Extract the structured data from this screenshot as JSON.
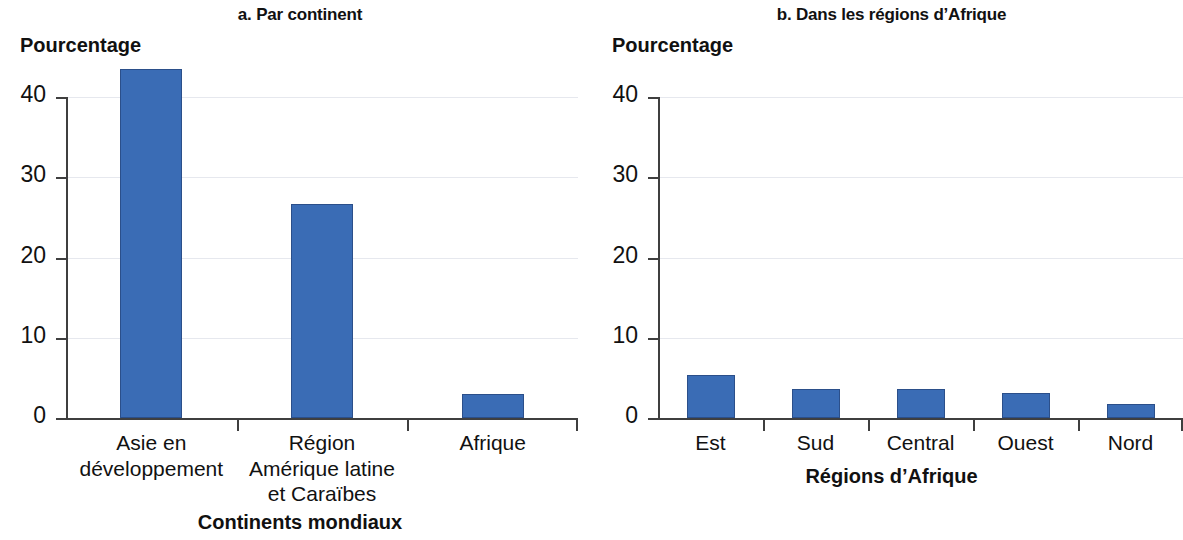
{
  "figure": {
    "background": "#ffffff",
    "bar_color": "#3a6cb5",
    "bar_edge_color": "#2b4f8a",
    "grid_color": "#e6e8ee",
    "axis_color": "#3f3f3f"
  },
  "chart_data": [
    {
      "type": "bar",
      "panel": "a",
      "title": "a. Par continent",
      "ylabel": "Pourcentage",
      "xlabel": "Continents mondiaux",
      "categories": [
        "Asie en\ndéveloppement",
        "Région\nAmérique latine\net Caraïbes",
        "Afrique"
      ],
      "values": [
        43.5,
        26.7,
        3.0
      ],
      "yticks": [
        "0",
        "10",
        "20",
        "30",
        "40"
      ],
      "ytick_values": [
        0,
        10,
        20,
        30,
        40
      ],
      "ylim": [
        0,
        44
      ],
      "grid": "horizontal",
      "legend": "none"
    },
    {
      "type": "bar",
      "panel": "b",
      "title": "b. Dans les régions d’Afrique",
      "ylabel": "Pourcentage",
      "xlabel": "Régions d’Afrique",
      "categories": [
        "Est",
        "Sud",
        "Central",
        "Ouest",
        "Nord"
      ],
      "values": [
        5.4,
        3.6,
        3.6,
        3.1,
        1.7
      ],
      "yticks": [
        "0",
        "10",
        "20",
        "30",
        "40"
      ],
      "ytick_values": [
        0,
        10,
        20,
        30,
        40
      ],
      "ylim": [
        0,
        44
      ],
      "grid": "horizontal",
      "legend": "none"
    }
  ]
}
